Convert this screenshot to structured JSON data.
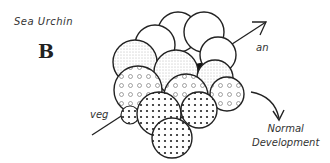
{
  "figure": {
    "title": "Sea Urchin",
    "panel_label": "B",
    "axis_labels": {
      "animal_pole": "an",
      "vegetal_pole": "veg"
    },
    "outcome": {
      "line1": "Normal",
      "line2": "Development"
    }
  }
}
